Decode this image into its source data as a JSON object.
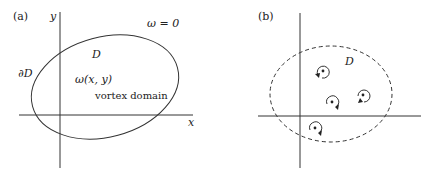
{
  "panel_a": {
    "label": "(a)",
    "axis_x": "x",
    "axis_y": "y",
    "omega_zero": "ω = 0",
    "domain": "D",
    "boundary": "∂D",
    "vorticity": "ω(x, y)",
    "caption": "vortex domain"
  },
  "panel_b": {
    "label": "(b)",
    "domain": "D",
    "vortex_count": "4"
  }
}
